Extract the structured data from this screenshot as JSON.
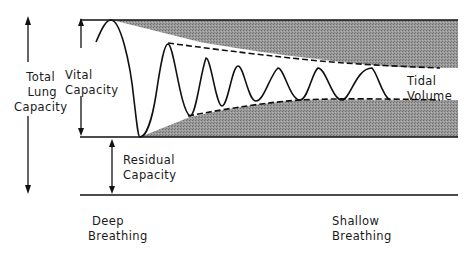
{
  "diagram": {
    "title": "",
    "labels": {
      "total_lung_capacity": [
        "Total",
        "Lung",
        "Capacity"
      ],
      "vital_capacity": [
        "Vital",
        "Capacity"
      ],
      "residual_capacity": [
        "Residual",
        "Capacity"
      ],
      "tidal_volume": [
        "Tidal",
        "Volume"
      ],
      "deep_breathing": [
        "Deep",
        "Breathing"
      ],
      "shallow_breathing": [
        "Shallow",
        "Breathing"
      ]
    },
    "colors": {
      "line": "#111111",
      "shade": "#8c8c8c",
      "background": "#ffffff"
    }
  }
}
